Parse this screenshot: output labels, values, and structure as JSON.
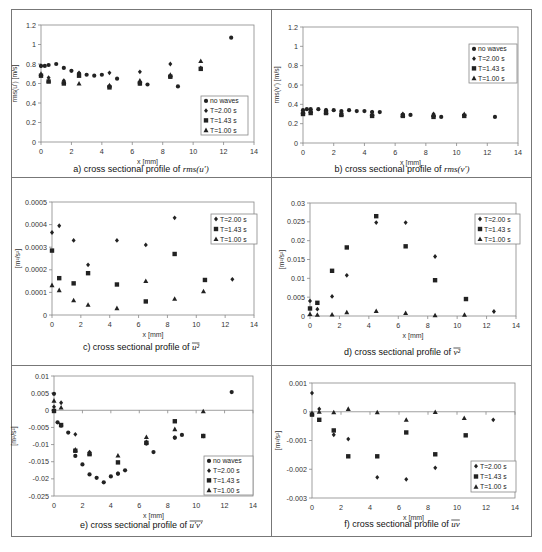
{
  "figure": {
    "panels": [
      {
        "id": "a",
        "caption_prefix": "a) cross sectional profile of ",
        "caption_symbol": "rms(u′)"
      },
      {
        "id": "b",
        "caption_prefix": "b) cross sectional profile of ",
        "caption_symbol": "rms(v′)"
      },
      {
        "id": "c",
        "caption_prefix": "c) cross sectional profile of ",
        "caption_symbol": "u²"
      },
      {
        "id": "d",
        "caption_prefix": "d) cross sectional profile of ",
        "caption_symbol": "v²"
      },
      {
        "id": "e",
        "caption_prefix": "e) cross sectional profile of ",
        "caption_symbol": "u′v′"
      },
      {
        "id": "f",
        "caption_prefix": "f) cross sectional profile of ",
        "caption_symbol": "uv"
      }
    ]
  },
  "chart_data": [
    {
      "id": "a",
      "type": "scatter",
      "title": "a) cross sectional profile of rms(u')",
      "xlabel": "x [mm]",
      "ylabel": "rms(u') [m/s]",
      "xlim": [
        0,
        14
      ],
      "ylim": [
        0,
        1.2
      ],
      "xticks": [
        0,
        2,
        4,
        6,
        8,
        10,
        12,
        14
      ],
      "yticks": [
        0,
        0.2,
        0.4,
        0.6,
        0.8,
        1,
        1.2
      ],
      "ytick_labels": [
        "0",
        "0.2",
        "0.4",
        "0.6",
        "0.8",
        "1",
        "1.2"
      ],
      "legend": {
        "position": "lower right",
        "entries": [
          "no waves",
          "T=2.00 s",
          "T=1.43 s",
          "T=1.00 s"
        ]
      },
      "grid": false,
      "series": [
        {
          "name": "no waves",
          "marker": "circle",
          "x": [
            0,
            0.25,
            0.5,
            1,
            1.5,
            2,
            2.5,
            3,
            3.5,
            4,
            4.5,
            5,
            6.5,
            7,
            8.5,
            9,
            12.5
          ],
          "y": [
            0.78,
            0.78,
            0.79,
            0.8,
            0.76,
            0.73,
            0.7,
            0.69,
            0.68,
            0.69,
            0.57,
            0.65,
            0.6,
            0.59,
            0.67,
            0.57,
            1.07
          ]
        },
        {
          "name": "T=2.00 s",
          "marker": "diamond",
          "x": [
            0,
            0.5,
            1.5,
            2.5,
            4.5,
            6.5,
            8.5,
            10.5
          ],
          "y": [
            0.78,
            0.66,
            0.63,
            0.71,
            0.71,
            0.72,
            0.8,
            0.76
          ]
        },
        {
          "name": "T=1.43 s",
          "marker": "square",
          "x": [
            0,
            0.5,
            1.5,
            2.5,
            4.5,
            6.5,
            8.5,
            10.5
          ],
          "y": [
            0.68,
            0.62,
            0.6,
            0.68,
            0.56,
            0.6,
            0.67,
            0.75
          ]
        },
        {
          "name": "T=1.00 s",
          "marker": "triangle",
          "x": [
            0,
            0.5,
            1.5,
            2.5,
            4.5,
            6.5,
            8.5,
            10.5
          ],
          "y": [
            0.7,
            0.63,
            0.62,
            0.6,
            0.58,
            0.63,
            0.69,
            0.83
          ]
        }
      ]
    },
    {
      "id": "b",
      "type": "scatter",
      "title": "b) cross sectional profile of rms(v')",
      "xlabel": "x [mm]",
      "ylabel": "rms(v') [m/s]",
      "xlim": [
        0,
        14
      ],
      "ylim": [
        0,
        1.2
      ],
      "xticks": [
        0,
        2,
        4,
        6,
        8,
        10,
        12,
        14
      ],
      "yticks": [
        0,
        0.2,
        0.4,
        0.6,
        0.8,
        1,
        1.2
      ],
      "ytick_labels": [
        "0",
        "0.2",
        "0.4",
        "0.6",
        "0.8",
        "1",
        "1.2"
      ],
      "legend": {
        "position": "upper right",
        "entries": [
          "no waves",
          "T=2.00 s",
          "T=1.43 s",
          "T=1.00 s"
        ]
      },
      "grid": false,
      "series": [
        {
          "name": "no waves",
          "marker": "circle",
          "x": [
            0,
            0.25,
            0.5,
            1,
            1.5,
            2,
            2.5,
            3,
            3.5,
            4,
            4.5,
            5,
            6.5,
            7,
            8.5,
            9,
            12.5
          ],
          "y": [
            0.34,
            0.35,
            0.35,
            0.35,
            0.34,
            0.34,
            0.33,
            0.34,
            0.33,
            0.33,
            0.32,
            0.32,
            0.29,
            0.29,
            0.28,
            0.27,
            0.27
          ]
        },
        {
          "name": "T=2.00 s",
          "marker": "diamond",
          "x": [
            0,
            0.5,
            1.5,
            2.5,
            4.5,
            6.5,
            8.5,
            10.5
          ],
          "y": [
            0.33,
            0.34,
            0.34,
            0.32,
            0.32,
            0.3,
            0.3,
            0.29
          ]
        },
        {
          "name": "T=1.43 s",
          "marker": "square",
          "x": [
            0,
            0.5,
            1.5,
            2.5,
            4.5,
            6.5,
            8.5,
            10.5
          ],
          "y": [
            0.3,
            0.31,
            0.31,
            0.29,
            0.28,
            0.28,
            0.27,
            0.28
          ]
        },
        {
          "name": "T=1.00 s",
          "marker": "triangle",
          "x": [
            0,
            0.5,
            1.5,
            2.5,
            4.5,
            6.5,
            8.5,
            10.5
          ],
          "y": [
            0.32,
            0.33,
            0.32,
            0.3,
            0.3,
            0.29,
            0.29,
            0.3
          ]
        }
      ]
    },
    {
      "id": "c",
      "type": "scatter",
      "title": "c) cross sectional profile of mean(u^2)",
      "xlabel": "x [mm]",
      "ylabel": "[m^2/s^2]",
      "xlim": [
        0,
        14
      ],
      "ylim": [
        0,
        0.0005
      ],
      "xticks": [
        0,
        2,
        4,
        6,
        8,
        10,
        12,
        14
      ],
      "yticks": [
        0,
        0.0001,
        0.0002,
        0.0003,
        0.0004,
        0.0005
      ],
      "ytick_labels": [
        "0",
        "0.0001",
        "0.0002",
        "0.0003",
        "0.0004",
        "0.0005"
      ],
      "legend": {
        "position": "upper right",
        "entries": [
          "T=2.00 s",
          "T=1.43 s",
          "T=1.00 s"
        ]
      },
      "grid": false,
      "series": [
        {
          "name": "T=2.00 s",
          "marker": "diamond",
          "x": [
            0,
            0.5,
            1.5,
            2.5,
            4.5,
            6.5,
            8.5,
            12.5
          ],
          "y": [
            0.000365,
            0.000395,
            0.00033,
            0.000222,
            0.00033,
            0.00031,
            0.00043,
            0.000158
          ]
        },
        {
          "name": "T=1.43 s",
          "marker": "square",
          "x": [
            0,
            0.5,
            1.5,
            2.5,
            4.5,
            6.5,
            8.5,
            10.6
          ],
          "y": [
            0.000285,
            0.000163,
            0.00014,
            0.000185,
            0.000135,
            6e-05,
            0.00027,
            0.000155
          ]
        },
        {
          "name": "T=1.00 s",
          "marker": "triangle",
          "x": [
            0,
            0.5,
            1.5,
            2.5,
            4.5,
            6.5,
            8.5,
            10.5
          ],
          "y": [
            0.000132,
            0.00011,
            6.5e-05,
            4.5e-05,
            3e-05,
            0.00015,
            7.2e-05,
            0.000105
          ]
        }
      ]
    },
    {
      "id": "d",
      "type": "scatter",
      "title": "d) cross sectional profile of mean(v^2)",
      "xlabel": "x [mm]",
      "ylabel": "[m^2/s^2]",
      "xlim": [
        0,
        14
      ],
      "ylim": [
        0,
        0.03
      ],
      "xticks": [
        0,
        2,
        4,
        6,
        8,
        10,
        12,
        14
      ],
      "yticks": [
        0,
        0.005,
        0.01,
        0.015,
        0.02,
        0.025,
        0.03
      ],
      "ytick_labels": [
        "0",
        "0.005",
        "0.01",
        "0.015",
        "0.02",
        "0.025",
        "0.03"
      ],
      "legend": {
        "position": "upper right",
        "entries": [
          "T=2.00 s",
          "T=1.43 s",
          "T=1.00 s"
        ]
      },
      "grid": false,
      "series": [
        {
          "name": "T=2.00 s",
          "marker": "diamond",
          "x": [
            0,
            0.5,
            1.5,
            2.5,
            4.5,
            6.5,
            8.5,
            12.5
          ],
          "y": [
            0.004,
            0.0018,
            0.0052,
            0.0108,
            0.0248,
            0.0248,
            0.0158,
            0.0012
          ]
        },
        {
          "name": "T=1.43 s",
          "marker": "square",
          "x": [
            0,
            0.5,
            1.5,
            2.5,
            4.5,
            6.5,
            8.5,
            10.6
          ],
          "y": [
            0.002,
            0.0035,
            0.012,
            0.0182,
            0.0265,
            0.0185,
            0.0095,
            0.0045
          ]
        },
        {
          "name": "T=1.00 s",
          "marker": "triangle",
          "x": [
            0,
            0.5,
            1.5,
            2.5,
            4.5,
            6.5,
            8.5,
            10.5
          ],
          "y": [
            0.0005,
            0.0003,
            0.0004,
            0.001,
            0.0013,
            0.0008,
            0.0002,
            0.0003
          ]
        }
      ]
    },
    {
      "id": "e",
      "type": "scatter",
      "title": "e) cross sectional profile of mean(u'v')",
      "xlabel": "x [mm]",
      "ylabel": "[m^2/s^2]",
      "xlim": [
        0,
        14
      ],
      "ylim": [
        -0.025,
        0.01
      ],
      "xticks": [
        0,
        2,
        4,
        6,
        8,
        10,
        12,
        14
      ],
      "yticks": [
        -0.025,
        -0.02,
        -0.015,
        -0.01,
        -0.005,
        0,
        0.005,
        0.01
      ],
      "ytick_labels": [
        "-0.025",
        "-0.02",
        "-0.015",
        "-0.01",
        "-0.005",
        "0",
        "0.005",
        "0.01"
      ],
      "legend": {
        "position": "lower right",
        "entries": [
          "no waves",
          "T=2.00 s",
          "T=1.43 s",
          "T=1.00 s"
        ]
      },
      "grid": false,
      "series": [
        {
          "name": "no waves",
          "marker": "circle",
          "x": [
            0,
            0.25,
            0.5,
            1,
            1.5,
            2,
            2.5,
            3,
            3.5,
            4,
            4.5,
            5,
            6.5,
            7,
            8.5,
            9,
            12.5
          ],
          "y": [
            0.0048,
            -0.0035,
            -0.0045,
            -0.0065,
            -0.0133,
            -0.0158,
            -0.0187,
            -0.0197,
            -0.021,
            -0.0193,
            -0.0185,
            -0.0175,
            -0.0097,
            -0.0122,
            -0.008,
            -0.0072,
            0.0053
          ]
        },
        {
          "name": "T=2.00 s",
          "marker": "diamond",
          "x": [
            0,
            0.5,
            1.5,
            2.5,
            4.5,
            6.5,
            8.5,
            10.5
          ],
          "y": [
            0.001,
            0.0022,
            -0.007,
            -0.0122,
            -0.0185,
            -0.0092,
            -0.008,
            -0.0075
          ]
        },
        {
          "name": "T=1.43 s",
          "marker": "square",
          "x": [
            0,
            0.5,
            1.5,
            2.5,
            4.5,
            6.5,
            8.5,
            10.5
          ],
          "y": [
            -0.0002,
            -0.0043,
            -0.0118,
            -0.0128,
            -0.0152,
            -0.0095,
            -0.0032,
            -0.0075
          ]
        },
        {
          "name": "T=1.00 s",
          "marker": "triangle",
          "x": [
            0,
            0.5,
            1.5,
            2.5,
            4.5,
            6.5,
            8.5,
            10.5
          ],
          "y": [
            0.0028,
            0.0008,
            -0.0115,
            -0.0125,
            -0.0132,
            -0.0078,
            -0.0055,
            -0.0003
          ]
        }
      ]
    },
    {
      "id": "f",
      "type": "scatter",
      "title": "f) cross sectional profile of mean(uv)",
      "xlabel": "x [mm]",
      "ylabel": "[m^2/s^2]",
      "xlim": [
        0,
        14
      ],
      "ylim": [
        -0.003,
        0.001
      ],
      "xticks": [
        0,
        2,
        4,
        6,
        8,
        10,
        12,
        14
      ],
      "yticks": [
        -0.003,
        -0.002,
        -0.001,
        0,
        0.001
      ],
      "ytick_labels": [
        "-0.003",
        "-0.002",
        "-0.001",
        "0",
        "0.001"
      ],
      "legend": {
        "position": "lower right",
        "entries": [
          "T=2.00 s",
          "T=1.43 s",
          "T=1.00 s"
        ]
      },
      "grid": false,
      "series": [
        {
          "name": "T=2.00 s",
          "marker": "diamond",
          "x": [
            0,
            0.5,
            1.5,
            2.5,
            4.5,
            6.5,
            8.5,
            12.5
          ],
          "y": [
            0.00065,
            0.0001,
            -0.0008,
            -0.00095,
            -0.00228,
            -0.00235,
            -0.00195,
            -0.00028
          ]
        },
        {
          "name": "T=1.43 s",
          "marker": "square",
          "x": [
            0,
            0.5,
            1.5,
            2.5,
            4.5,
            6.5,
            8.5,
            10.6
          ],
          "y": [
            -0.0001,
            -0.00028,
            -0.00065,
            -0.00155,
            -0.00155,
            -0.00072,
            -0.00148,
            -0.00082
          ]
        },
        {
          "name": "T=1.00 s",
          "marker": "triangle",
          "x": [
            0,
            0.5,
            1.5,
            2.5,
            4.5,
            6.5,
            8.5,
            10.5
          ],
          "y": [
            -5e-05,
            0.0,
            -2e-05,
            0.0001,
            -2e-05,
            -0.00028,
            -1e-05,
            -0.00022
          ]
        }
      ]
    }
  ]
}
